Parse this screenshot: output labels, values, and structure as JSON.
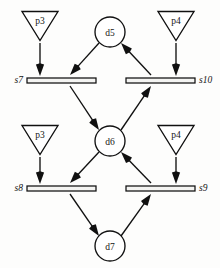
{
  "diagram": {
    "canvas": {
      "width": 220,
      "height": 268
    },
    "colors": {
      "background": "#fdfdfc",
      "stroke": "#101010",
      "node_fill": "#ffffff",
      "bar_fill": "#f4f4f2",
      "label": "#151515"
    },
    "transitions": [
      {
        "id": "p3-top",
        "label": "p3",
        "shape": "inverted-triangle",
        "cx": 40,
        "cy": 26,
        "half_width": 18,
        "height": 29
      },
      {
        "id": "p4-top",
        "label": "p4",
        "shape": "inverted-triangle",
        "cx": 176,
        "cy": 26,
        "half_width": 18,
        "height": 29
      },
      {
        "id": "p3-bottom",
        "label": "p3",
        "shape": "inverted-triangle",
        "cx": 40,
        "cy": 140,
        "half_width": 18,
        "height": 29
      },
      {
        "id": "p4-bottom",
        "label": "p4",
        "shape": "inverted-triangle",
        "cx": 176,
        "cy": 140,
        "half_width": 18,
        "height": 29
      }
    ],
    "places": [
      {
        "id": "d5",
        "label": "d5",
        "shape": "circle",
        "cx": 110,
        "cy": 32,
        "r": 15
      },
      {
        "id": "d6",
        "label": "d6",
        "shape": "circle",
        "cx": 110,
        "cy": 141,
        "r": 15
      },
      {
        "id": "d7",
        "label": "d7",
        "shape": "circle",
        "cx": 110,
        "cy": 246,
        "r": 15
      }
    ],
    "bars": [
      {
        "id": "s7",
        "label": "s7",
        "x": 27,
        "y": 78,
        "width": 69,
        "height": 5,
        "label_side": "left",
        "label_x": 23,
        "label_y": 80
      },
      {
        "id": "s10",
        "label": "s10",
        "x": 126,
        "y": 78,
        "width": 69,
        "height": 5,
        "label_side": "right",
        "label_x": 199,
        "label_y": 80
      },
      {
        "id": "s8",
        "label": "s8",
        "x": 27,
        "y": 186,
        "width": 69,
        "height": 5,
        "label_side": "left",
        "label_x": 23,
        "label_y": 188
      },
      {
        "id": "s9",
        "label": "s9",
        "x": 126,
        "y": 186,
        "width": 69,
        "height": 5,
        "label_side": "right",
        "label_x": 199,
        "label_y": 188
      }
    ],
    "arcs": [
      {
        "id": "p3top-to-s7",
        "from": "p3-top",
        "to": "s7",
        "x1": 40,
        "y1": 43,
        "x2": 40,
        "y2": 76
      },
      {
        "id": "p4top-to-s10",
        "from": "p4-top",
        "to": "s10",
        "x1": 176,
        "y1": 43,
        "x2": 176,
        "y2": 76
      },
      {
        "id": "p3bot-to-s8",
        "from": "p3-bottom",
        "to": "s8",
        "x1": 40,
        "y1": 157,
        "x2": 40,
        "y2": 184
      },
      {
        "id": "p4bot-to-s9",
        "from": "p4-bottom",
        "to": "s9",
        "x1": 176,
        "y1": 157,
        "x2": 176,
        "y2": 184
      },
      {
        "id": "d5-to-s7",
        "from": "d5",
        "to": "s7",
        "x1": 99,
        "y1": 43,
        "x2": 70,
        "y2": 75
      },
      {
        "id": "s10-to-d5",
        "from": "s10",
        "to": "d5",
        "x1": 151,
        "y1": 75,
        "x2": 121,
        "y2": 43
      },
      {
        "id": "s7-to-d6",
        "from": "s7",
        "to": "d6",
        "x1": 70,
        "y1": 86,
        "x2": 99,
        "y2": 130
      },
      {
        "id": "d6-to-s10",
        "from": "d6",
        "to": "s10",
        "x1": 121,
        "y1": 130,
        "x2": 151,
        "y2": 86
      },
      {
        "id": "d6-to-s8",
        "from": "d6",
        "to": "s8",
        "x1": 99,
        "y1": 152,
        "x2": 70,
        "y2": 183
      },
      {
        "id": "s9-to-d6",
        "from": "s9",
        "to": "d6",
        "x1": 151,
        "y1": 183,
        "x2": 121,
        "y2": 152
      },
      {
        "id": "s8-to-d7",
        "from": "s8",
        "to": "d7",
        "x1": 70,
        "y1": 194,
        "x2": 99,
        "y2": 236
      },
      {
        "id": "d7-to-s9",
        "from": "d7",
        "to": "s9",
        "x1": 121,
        "y1": 236,
        "x2": 151,
        "y2": 194
      }
    ]
  }
}
